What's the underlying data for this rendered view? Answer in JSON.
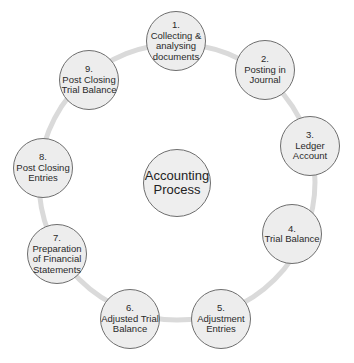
{
  "diagram": {
    "center": {
      "lines": [
        "Accounting",
        "Process"
      ]
    },
    "ring_color": "#d9d9d9",
    "node_fill": "#ededed",
    "node_stroke": "#6e6e6e",
    "steps": [
      {
        "number": "1.",
        "lines": [
          "Collecting &",
          "analysing",
          "documents"
        ],
        "cx": 176,
        "cy": 41
      },
      {
        "number": "2.",
        "lines": [
          "Posting in",
          "Journal"
        ],
        "cx": 265,
        "cy": 70
      },
      {
        "number": "3.",
        "lines": [
          "Ledger",
          "Account"
        ],
        "cx": 310,
        "cy": 146
      },
      {
        "number": "4.",
        "lines": [
          "Trial Balance"
        ],
        "cx": 292,
        "cy": 234
      },
      {
        "number": "5.",
        "lines": [
          "Adjustment",
          "Entries"
        ],
        "cx": 221,
        "cy": 319
      },
      {
        "number": "6.",
        "lines": [
          "Adjusted Trial",
          "Balance"
        ],
        "cx": 130,
        "cy": 319
      },
      {
        "number": "7.",
        "lines": [
          "Preparation",
          "of Financial",
          "Statements"
        ],
        "cx": 57,
        "cy": 254
      },
      {
        "number": "8.",
        "lines": [
          "Post Closing",
          "Entries"
        ],
        "cx": 43,
        "cy": 168
      },
      {
        "number": "9.",
        "lines": [
          "Post Closing",
          "Trial Balance"
        ],
        "cx": 89,
        "cy": 80
      }
    ]
  }
}
